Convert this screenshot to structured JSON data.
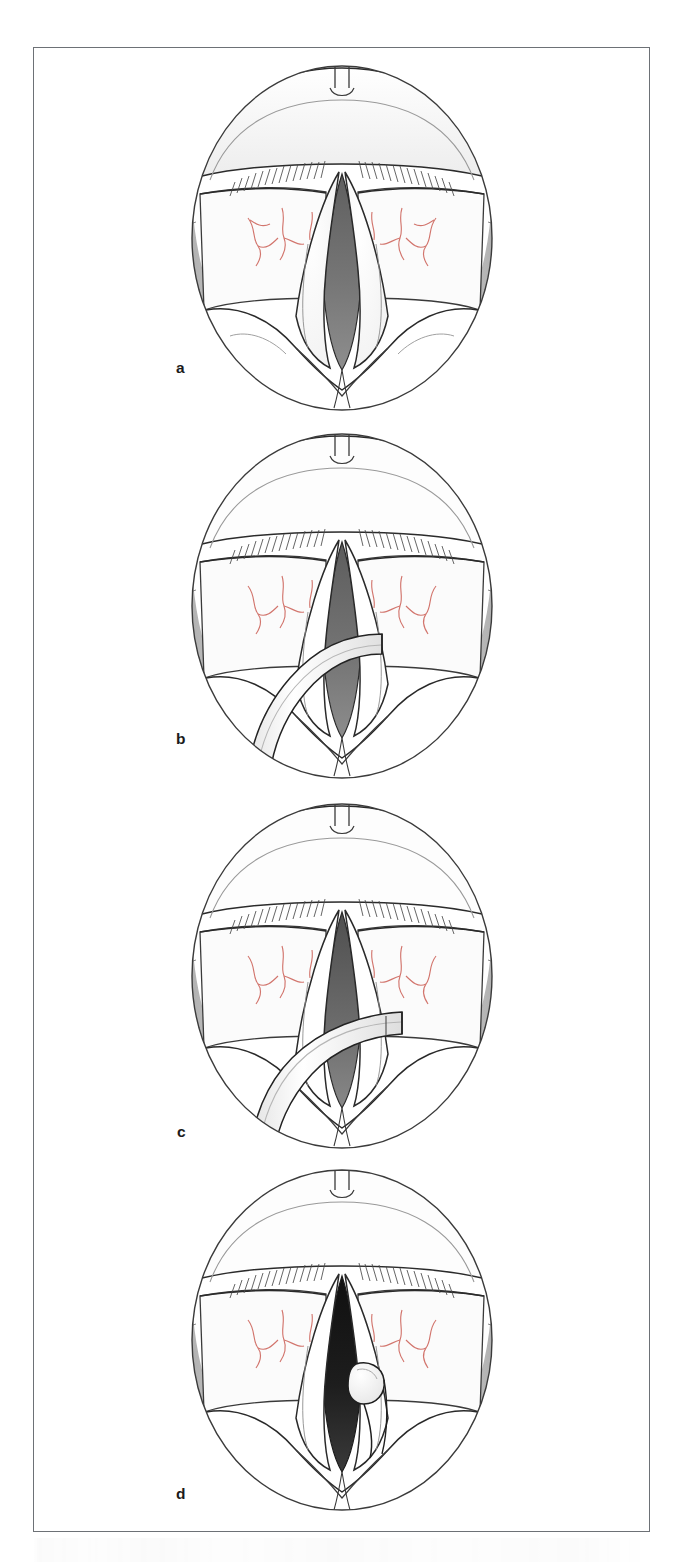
{
  "figure": {
    "kind": "medical-illustration",
    "panel_count": 4,
    "border_color": "#6d7176",
    "background_color": "#ffffff"
  },
  "palette": {
    "outline": "#232323",
    "outline_soft": "#4a4a4a",
    "tissue_white": "#ffffff",
    "tissue_shade": "#e9eaea",
    "pharynx_gray": "#b5b5b5",
    "pharynx_gray_dark": "#9a9a9a",
    "airway_gray": "#6e6e6e",
    "airway_gray_light": "#8b8b8b",
    "airway_dark": "#141414",
    "vessel_red": "#d2756d",
    "label_color": "#1b1b1b"
  },
  "panels": [
    {
      "id": "a",
      "label": "a",
      "caption": "Laryngoscopic view of the glottis at rest; vocal folds apart, airway open",
      "airway": "mid-gray",
      "instrument": "none",
      "implant": "none"
    },
    {
      "id": "b",
      "label": "b",
      "caption": "Injection cannula introduced from below, crossing the glottic aperture",
      "airway": "mid-gray",
      "instrument": "curved-cannula-lower-left",
      "implant": "none"
    },
    {
      "id": "c",
      "label": "c",
      "caption": "Cannula advanced and angled toward the right vocal fold for needle placement",
      "airway": "mid-gray",
      "instrument": "cannula-angled-to-right-fold",
      "implant": "none"
    },
    {
      "id": "d",
      "label": "d",
      "caption": "Cannula withdrawn; augmented right vocal fold shows medialized bulge",
      "airway": "dark",
      "instrument": "none",
      "implant": "medialization-bulge-right-fold"
    }
  ],
  "anatomy_labels": [
    "epiglottis",
    "petiole-notch",
    "false-vocal-fold",
    "true-vocal-fold",
    "glottic-airway",
    "arytenoid-region",
    "pyriform-sinus",
    "aryepiglottic-fold",
    "mucosal-vessels"
  ],
  "bottom_edge": {
    "content": "faint bleed-through of underlying caption text, illegible"
  }
}
